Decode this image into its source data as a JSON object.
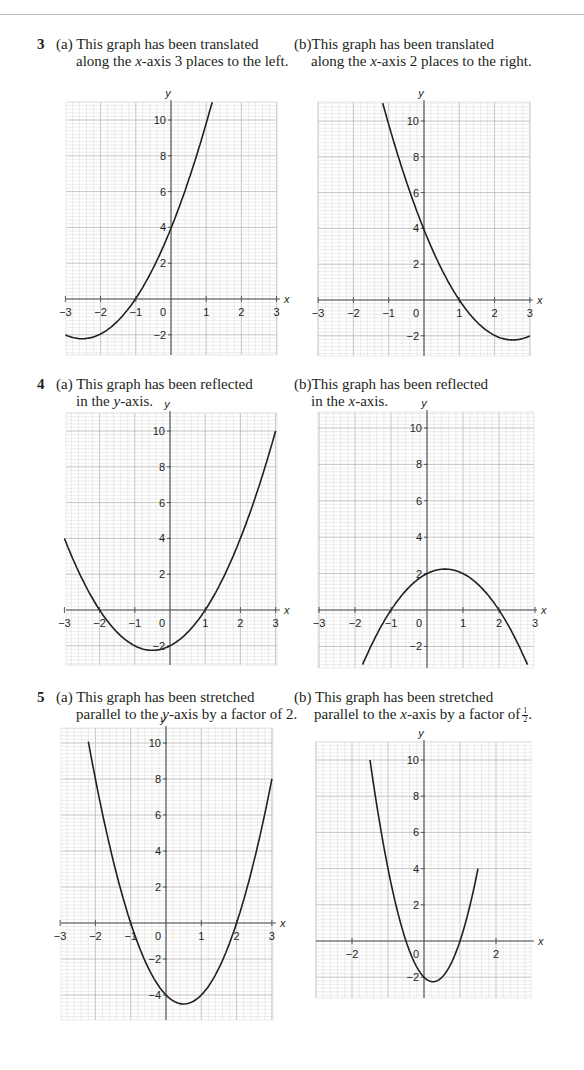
{
  "questions": [
    {
      "number": "3",
      "parts": [
        {
          "label": "(a)",
          "line1": "This graph has been translated",
          "line2_pre": "along the ",
          "line2_var": "x",
          "line2_post": "-axis 3 places to the left."
        },
        {
          "label": "(b)",
          "line1": "This graph has been translated",
          "line2_pre": "along the ",
          "line2_var": "x",
          "line2_post": "-axis 2 places to the right."
        }
      ]
    },
    {
      "number": "4",
      "parts": [
        {
          "label": "(a)",
          "line1": "This graph has been reflected",
          "line2_pre": "in the ",
          "line2_var": "y",
          "line2_post": "-axis."
        },
        {
          "label": "(b)",
          "line1": "This graph has been reflected",
          "line2_pre": "in the ",
          "line2_var": "x",
          "line2_post": "-axis."
        }
      ]
    },
    {
      "number": "5",
      "parts": [
        {
          "label": "(a)",
          "line1": "This graph has been stretched",
          "line2_pre": "parallel to the ",
          "line2_var": "y",
          "line2_post": "-axis by a factor of 2."
        },
        {
          "label": "(b)",
          "line1": "This graph has been stretched",
          "line2_pre": "parallel to the ",
          "line2_var": "x",
          "line2_post": "-axis by a factor of",
          "fraction_num": "1",
          "fraction_den": "2",
          "trailing": "."
        }
      ]
    }
  ],
  "axis_labels": {
    "x": "x",
    "y": "y"
  },
  "colors": {
    "grid_minor": "#d9d9d9",
    "grid_major": "#b5b5b5",
    "axis": "#555555",
    "curve": "#231f20",
    "text": "#231f20"
  },
  "chart_data": [
    {
      "id": "3a",
      "type": "line",
      "title": "Translated along the x-axis 3 places to the left",
      "xlabel": "x",
      "ylabel": "y",
      "xlim": [
        -3,
        3
      ],
      "ylim": [
        -3,
        11
      ],
      "grid": true,
      "xticks": [
        -3,
        -2,
        -1,
        0,
        1,
        2,
        3
      ],
      "yticks": [
        -2,
        2,
        4,
        6,
        8,
        10
      ],
      "equation": "y = x^2 + 5x + 4",
      "x": [
        -3,
        -2.5,
        -2,
        -1.5,
        -1,
        -0.5,
        0,
        0.5,
        1,
        1.17
      ],
      "y": [
        -2,
        -2.25,
        -2,
        -1.25,
        0,
        1.75,
        4,
        6.75,
        10,
        11
      ]
    },
    {
      "id": "3b",
      "type": "line",
      "title": "Translated along the x-axis 2 places to the right",
      "xlabel": "x",
      "ylabel": "y",
      "xlim": [
        -3,
        3
      ],
      "ylim": [
        -3,
        11
      ],
      "grid": true,
      "xticks": [
        -3,
        -2,
        -1,
        0,
        1,
        2,
        3
      ],
      "yticks": [
        -2,
        2,
        4,
        6,
        8,
        10
      ],
      "equation": "y = x^2 - 5x + 4",
      "x": [
        -1.17,
        -1,
        -0.5,
        0,
        0.5,
        1,
        1.5,
        2,
        2.5,
        3
      ],
      "y": [
        11,
        10,
        6.75,
        4,
        1.75,
        0,
        -1.25,
        -2,
        -2.25,
        -2
      ]
    },
    {
      "id": "4a",
      "type": "line",
      "title": "Reflected in the y-axis",
      "xlabel": "x",
      "ylabel": "y",
      "xlim": [
        -3,
        3
      ],
      "ylim": [
        -3,
        11
      ],
      "grid": true,
      "xticks": [
        -3,
        -2,
        -1,
        0,
        1,
        2,
        3
      ],
      "yticks": [
        -2,
        2,
        4,
        6,
        8,
        10
      ],
      "equation": "y = x^2 + x - 2",
      "x": [
        -3,
        -2.5,
        -2,
        -1.5,
        -1,
        -0.5,
        0,
        0.5,
        1,
        1.5,
        2,
        2.5,
        3
      ],
      "y": [
        4,
        1.75,
        0,
        -1.25,
        -2,
        -2.25,
        -2,
        -1.25,
        0,
        1.75,
        4,
        6.75,
        10
      ]
    },
    {
      "id": "4b",
      "type": "line",
      "title": "Reflected in the x-axis",
      "xlabel": "x",
      "ylabel": "y",
      "xlim": [
        -3,
        3
      ],
      "ylim": [
        -3,
        11
      ],
      "grid": true,
      "xticks": [
        -3,
        -2,
        -1,
        0,
        1,
        2,
        3
      ],
      "yticks": [
        -2,
        2,
        4,
        6,
        8,
        10
      ],
      "equation": "y = -x^2 + x + 2",
      "x": [
        -1.79,
        -1.5,
        -1,
        -0.5,
        0,
        0.5,
        1,
        1.5,
        2,
        2.5,
        2.79
      ],
      "y": [
        -3,
        -1.75,
        0,
        1.25,
        2,
        2.25,
        2,
        1.25,
        0,
        -1.75,
        -3
      ]
    },
    {
      "id": "5a",
      "type": "line",
      "title": "Stretched parallel to the y-axis by a factor of 2",
      "xlabel": "x",
      "ylabel": "y",
      "xlim": [
        -3,
        3
      ],
      "ylim": [
        -5.5,
        11
      ],
      "grid": true,
      "xticks": [
        -3,
        -2,
        -1,
        0,
        1,
        2,
        3
      ],
      "yticks": [
        -4,
        -2,
        2,
        4,
        6,
        8,
        10
      ],
      "equation": "y = 2x^2 - 2x - 4",
      "x": [
        -2.2,
        -2,
        -1.5,
        -1,
        -0.5,
        0,
        0.5,
        1,
        1.5,
        2,
        2.5,
        3
      ],
      "y": [
        10.08,
        8,
        3.5,
        0,
        -2.5,
        -4,
        -4.5,
        -4,
        -2.5,
        0,
        3.5,
        8
      ]
    },
    {
      "id": "5b",
      "type": "line",
      "title": "Stretched parallel to the x-axis by a factor of 1/2",
      "xlabel": "x",
      "ylabel": "y",
      "xlim": [
        -3,
        3
      ],
      "ylim": [
        -3,
        11
      ],
      "grid": true,
      "xticks": [
        -2,
        2
      ],
      "yticks": [
        -2,
        2,
        4,
        6,
        8,
        10
      ],
      "equation": "y = 4x^2 - 2x - 2",
      "x": [
        -1.5,
        -1.25,
        -1,
        -0.75,
        -0.5,
        -0.25,
        0,
        0.25,
        0.5,
        0.75,
        1,
        1.25,
        1.5
      ],
      "y": [
        10,
        6.75,
        4,
        1.75,
        0,
        -1.25,
        -2,
        -2.25,
        -2,
        -1.25,
        0,
        1.75,
        4
      ]
    }
  ]
}
